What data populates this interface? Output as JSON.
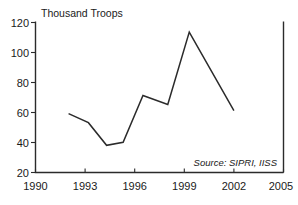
{
  "chart_data": {
    "type": "line",
    "title": "",
    "ylabel": "Thousand Troops",
    "xlabel": "",
    "xlim": [
      1990,
      2005
    ],
    "ylim": [
      20,
      120
    ],
    "xticks": [
      1990,
      1993,
      1996,
      1999,
      2002,
      2005
    ],
    "yticks": [
      20,
      40,
      60,
      80,
      100,
      120
    ],
    "xtick_labels": [
      "1990",
      "1993",
      "1996",
      "1999",
      "2002",
      "2005"
    ],
    "ytick_labels": [
      "20",
      "40",
      "60",
      "80",
      "100",
      "120"
    ],
    "grid": false,
    "legend": false,
    "annotation": "Source: SIPRI, IISS",
    "line_color": "#2b2b2b",
    "series": [
      {
        "name": "Troops",
        "x": [
          1992.0,
          1993.2,
          1994.3,
          1995.3,
          1996.5,
          1998.0,
          1999.3,
          2002.0
        ],
        "values": [
          59,
          53,
          38,
          40,
          71,
          65,
          113,
          61
        ]
      }
    ]
  },
  "figure": {
    "y_axis_title": "Thousand Troops",
    "source_note": "Source: SIPRI, IISS",
    "x_labels": [
      "1990",
      "1993",
      "1996",
      "1999",
      "2002",
      "2005"
    ],
    "y_labels": [
      "120",
      "100",
      "80",
      "60",
      "40",
      "20"
    ]
  }
}
